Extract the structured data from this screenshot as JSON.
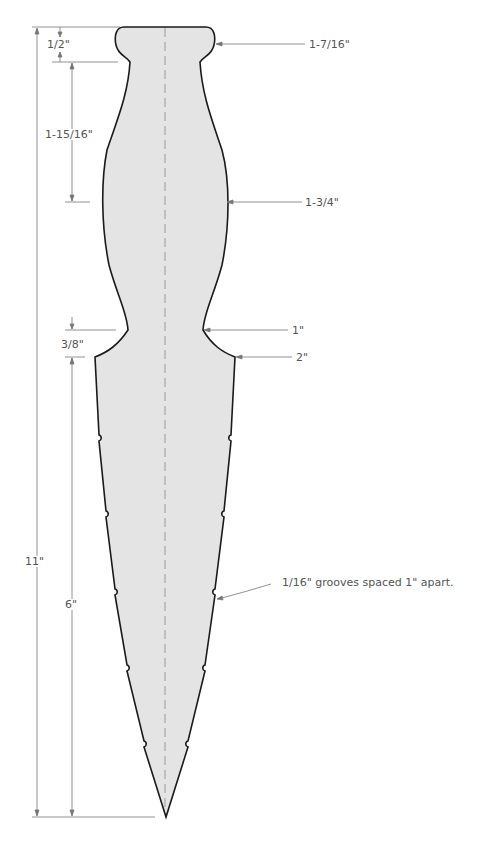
{
  "diagram": {
    "colors": {
      "fill": "#e4e4e4",
      "outline": "#1a1a1a",
      "dimension_line": "#777777",
      "centerline": "#999999",
      "text": "#555555"
    },
    "dimensions": {
      "overall_length": "11\"",
      "pommel_height": "1/2\"",
      "pommel_width": "1-7/16\"",
      "upper_grip_length": "1-15/16\"",
      "grip_max_width": "1-3/4\"",
      "waist_width": "1\"",
      "guard_transition": "3/8\"",
      "blade_base_width": "2\"",
      "blade_length": "6\""
    },
    "annotations": {
      "grooves_note": "1/16\" grooves spaced 1\" apart."
    }
  }
}
